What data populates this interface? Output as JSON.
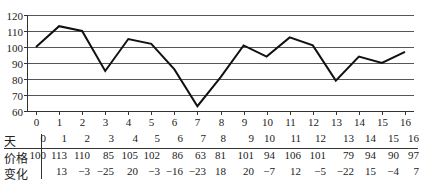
{
  "chart_data": {
    "type": "line",
    "title": "",
    "xlabel": "",
    "ylabel": "",
    "x": [
      0,
      1,
      2,
      3,
      4,
      5,
      6,
      7,
      8,
      9,
      10,
      11,
      12,
      13,
      14,
      15,
      16
    ],
    "series": [
      {
        "name": "价格",
        "values": [
          100,
          113,
          110,
          85,
          105,
          102,
          86,
          63,
          81,
          101,
          94,
          106,
          101,
          79,
          94,
          90,
          97
        ]
      }
    ],
    "ylim": [
      60,
      120
    ],
    "xlim": [
      0,
      16
    ],
    "yticks": [
      60,
      70,
      80,
      90,
      100,
      110,
      120
    ],
    "xticks": [
      0,
      1,
      2,
      3,
      4,
      5,
      6,
      7,
      8,
      9,
      10,
      11,
      12,
      13,
      14,
      15,
      16
    ],
    "grid": "horizontal",
    "legend": "none"
  },
  "table": {
    "row_labels": [
      "天",
      "价格",
      "变化"
    ],
    "days": [
      "0",
      "1",
      "2",
      "3",
      "4",
      "5",
      "6",
      "7",
      "8",
      "9",
      "10",
      "11",
      "12",
      "13",
      "14",
      "15",
      "16"
    ],
    "prices": [
      "100",
      "113",
      "110",
      "85",
      "105",
      "102",
      "86",
      "63",
      "81",
      "101",
      "94",
      "106",
      "101",
      "79",
      "94",
      "90",
      "97"
    ],
    "changes": [
      "",
      "13",
      "−3",
      "−25",
      "20",
      "−3",
      "−16",
      "−23",
      "18",
      "20",
      "−7",
      "12",
      "−5",
      "−22",
      "15",
      "−4",
      "7"
    ]
  }
}
